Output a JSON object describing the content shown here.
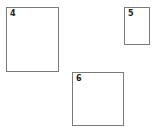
{
  "boxes": [
    {
      "id": "4",
      "label": "4",
      "x": 6,
      "y": 7,
      "w": 53,
      "h": 65
    },
    {
      "id": "5",
      "label": "5",
      "x": 124,
      "y": 7,
      "w": 26,
      "h": 38
    },
    {
      "id": "6",
      "label": "6",
      "x": 72,
      "y": 72,
      "w": 52,
      "h": 54
    }
  ]
}
